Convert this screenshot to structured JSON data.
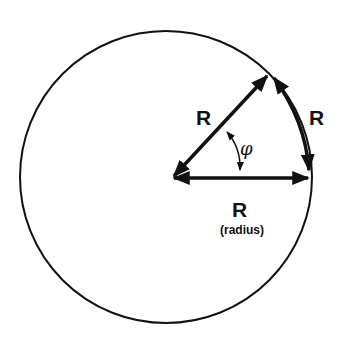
{
  "diagram": {
    "labels": {
      "radius_upper": "R",
      "arc": "R",
      "angle": "φ",
      "radius_lower": "R",
      "radius_caption": "(radius)"
    },
    "colors": {
      "stroke": "#111111",
      "background": "#ffffff"
    }
  }
}
